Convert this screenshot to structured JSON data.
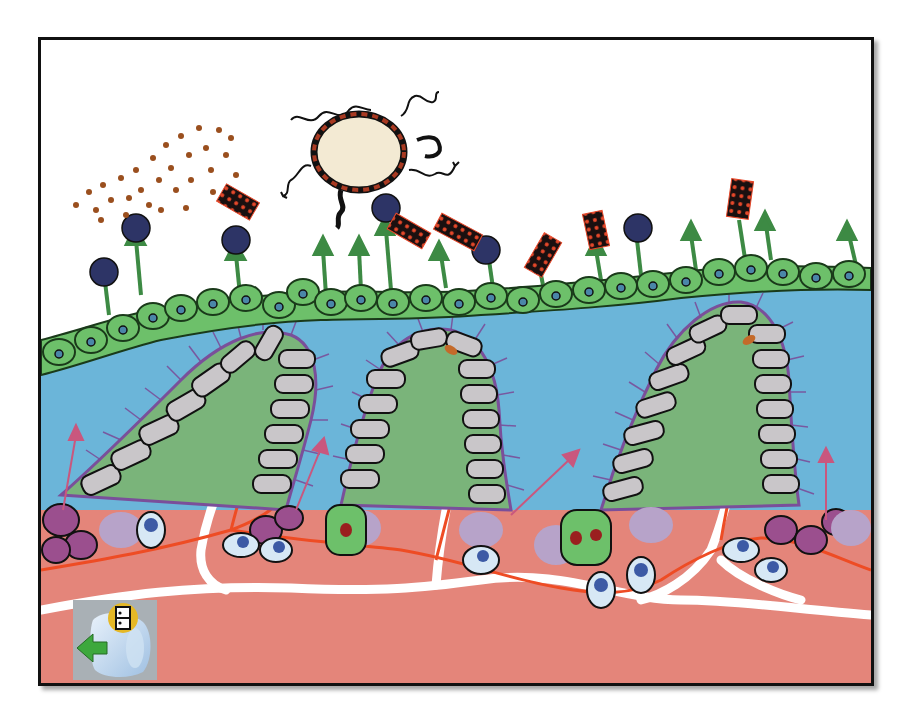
{
  "figure": {
    "type": "illustration",
    "colors": {
      "background": "#ffffff",
      "border": "#111111",
      "lumen_layer": "#6bb5d9",
      "surface_cells": "#6dc06a",
      "surface_cell_nucleus": "#4a86a8",
      "villus_cells": "#c9c6c9",
      "villus_core": "#7ab47a",
      "microvilli": "#7a4f9a",
      "lamina_propria": "#e4857a",
      "lymph_vessel": "#ffffff",
      "blood_vessel": "#ee4c24",
      "bacterium_body": "#f3ead3",
      "bacterium_rim": "#a83a22",
      "antigen_dots": "#9a4f1e",
      "dark_particle": "#2d3466",
      "rod_particle": "#1a1010",
      "rod_spots": "#e8482a",
      "secretion_arrow": "#3d8a44",
      "pink_arrow": "#c9577e",
      "immune_cell_light": "#d7e8f5",
      "immune_cell_nucleus": "#3c5aa5",
      "plasma_cell": "#9b4f8e",
      "mast_cell": "#b7a3c9"
    },
    "counts": {
      "villi": 3,
      "dark_particles": 7,
      "rod_particles": 6,
      "bacteria": 1
    }
  },
  "nav": {
    "back_button": {
      "icon": "back-arrow-icon",
      "badge_icon": "page-badge-icon",
      "arrow_color": "#3da83d",
      "badge_color": "#e5b826"
    }
  }
}
